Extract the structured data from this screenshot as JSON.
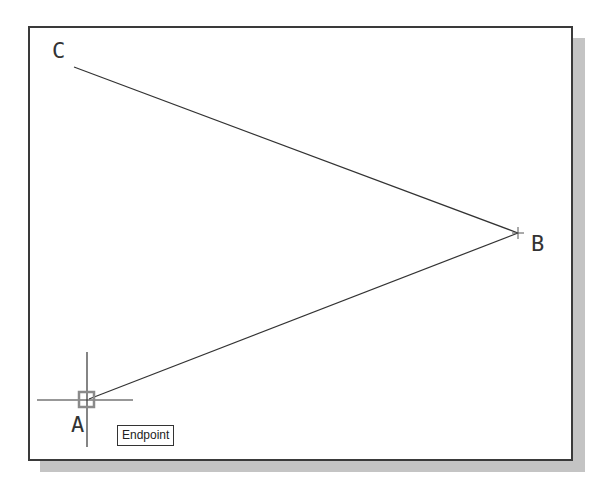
{
  "drawing": {
    "points": {
      "A": {
        "label": "A",
        "x": 87,
        "y": 400
      },
      "B": {
        "label": "B",
        "x": 518,
        "y": 233
      },
      "C": {
        "label": "C",
        "x": 74,
        "y": 67
      }
    },
    "lines": [
      {
        "from": "C",
        "to": "B"
      },
      {
        "from": "B",
        "to": "A"
      }
    ]
  },
  "snap": {
    "tooltip": "Endpoint",
    "marker_color": "#8a8a8a"
  },
  "colors": {
    "line": "#333333",
    "frame": "#3a3a3a",
    "shadow": "#c4c4c4"
  }
}
